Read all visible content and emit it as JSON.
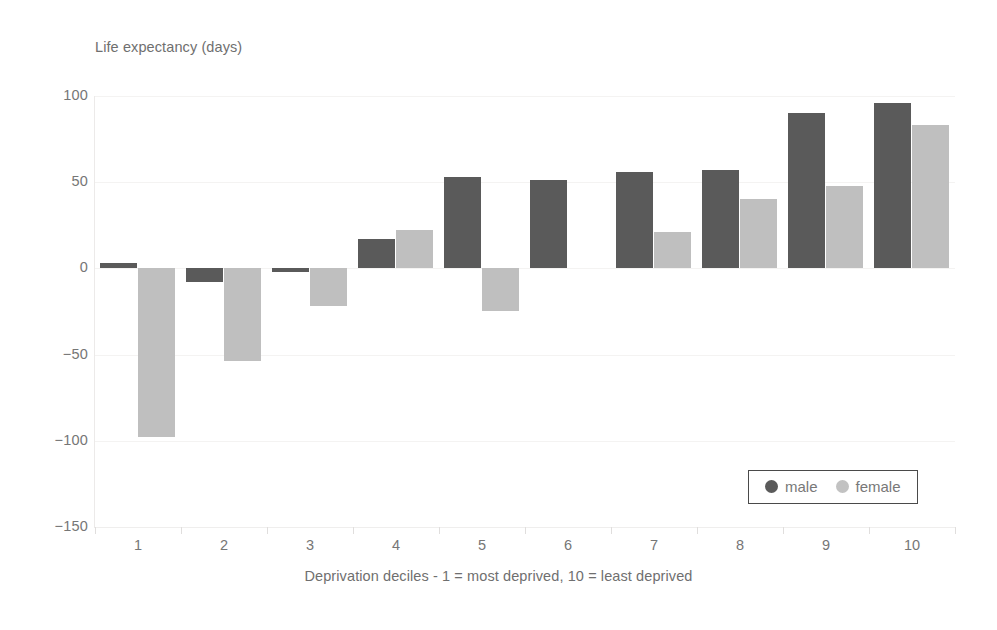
{
  "chart_data": {
    "type": "bar",
    "title": "",
    "ylabel": "Life expectancy (days)",
    "xlabel": "Deprivation deciles - 1 = most deprived, 10 = least deprived",
    "categories": [
      "1",
      "2",
      "3",
      "4",
      "5",
      "6",
      "7",
      "8",
      "9",
      "10"
    ],
    "series": [
      {
        "name": "male",
        "color": "#5a5a5a",
        "values": [
          3,
          -8,
          -2,
          17,
          53,
          51,
          56,
          57,
          90,
          96
        ]
      },
      {
        "name": "female",
        "color": "#bfbfbf",
        "values": [
          -98,
          -54,
          -22,
          22,
          -25,
          0,
          21,
          40,
          48,
          83
        ]
      }
    ],
    "ylim": [
      -150,
      100
    ],
    "yticks": [
      100,
      50,
      0,
      -50,
      -100,
      -150
    ],
    "ytick_labels": [
      "100",
      "50",
      "0",
      "−50",
      "−100",
      "−150"
    ],
    "grid": true,
    "legend_position": "bottom-right",
    "legend_entries": [
      "male",
      "female"
    ]
  },
  "colors": {
    "male": "#5a5a5a",
    "female": "#bfbfbf",
    "grid": "#f4f3f2",
    "axis": "#e8e6e5",
    "text": "#767676",
    "background": "#ffffff"
  }
}
